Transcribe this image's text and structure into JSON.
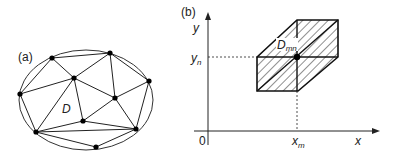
{
  "panel_a": {
    "label": "(a)",
    "region_label": "D",
    "ellipse": {
      "cx": 86,
      "cy": 100,
      "rx": 67,
      "ry": 50
    },
    "nodes": [
      {
        "id": "A",
        "x": 52,
        "y": 58
      },
      {
        "id": "B",
        "x": 110,
        "y": 53
      },
      {
        "id": "C",
        "x": 74,
        "y": 78
      },
      {
        "id": "D",
        "x": 149,
        "y": 81
      },
      {
        "id": "E",
        "x": 20,
        "y": 94
      },
      {
        "id": "F",
        "x": 115,
        "y": 98
      },
      {
        "id": "G",
        "x": 83,
        "y": 121
      },
      {
        "id": "H",
        "x": 36,
        "y": 132
      },
      {
        "id": "I",
        "x": 136,
        "y": 129
      },
      {
        "id": "J",
        "x": 96,
        "y": 147
      }
    ],
    "edges": [
      [
        "A",
        "B"
      ],
      [
        "A",
        "C"
      ],
      [
        "A",
        "E"
      ],
      [
        "B",
        "C"
      ],
      [
        "B",
        "D"
      ],
      [
        "B",
        "F"
      ],
      [
        "C",
        "E"
      ],
      [
        "C",
        "F"
      ],
      [
        "C",
        "G"
      ],
      [
        "C",
        "H"
      ],
      [
        "D",
        "F"
      ],
      [
        "D",
        "I"
      ],
      [
        "E",
        "H"
      ],
      [
        "F",
        "G"
      ],
      [
        "F",
        "I"
      ],
      [
        "G",
        "H"
      ],
      [
        "G",
        "I"
      ],
      [
        "H",
        "J"
      ],
      [
        "H",
        "I"
      ],
      [
        "I",
        "J"
      ]
    ]
  },
  "panel_b": {
    "label": "(b)",
    "axis_x_label": "x",
    "axis_y_label": "y",
    "origin_label": "0",
    "xm_label_main": "x",
    "xm_label_sub": "m",
    "yn_label_main": "y",
    "yn_label_sub": "n",
    "domain_label_main": "D",
    "domain_label_sub": "mn",
    "hexagon": [
      [
        297,
        20
      ],
      [
        338,
        20
      ],
      [
        338,
        57
      ],
      [
        298,
        91
      ],
      [
        257,
        91
      ],
      [
        257,
        57
      ]
    ],
    "center": {
      "x": 297,
      "y": 57
    }
  }
}
